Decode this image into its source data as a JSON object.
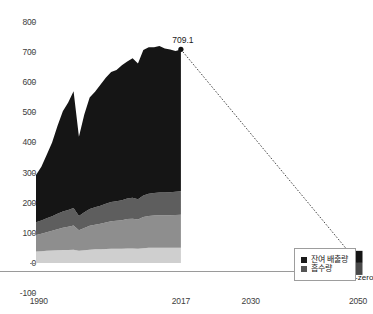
{
  "chart_data": {
    "type": "area",
    "title": "",
    "subtitle": "",
    "xlabel": "",
    "ylabel": "",
    "xlim": [
      1990,
      2050
    ],
    "ylim": [
      -100,
      800
    ],
    "ytick_labels": [
      "800",
      "700",
      "600",
      "500",
      "400",
      "300",
      "200",
      "100",
      "0",
      "-100"
    ],
    "ytick_values": [
      800,
      700,
      600,
      500,
      400,
      300,
      200,
      100,
      0,
      -100
    ],
    "xtick_labels": [
      "1990",
      "2017",
      "2030",
      "2050"
    ],
    "xtick_values": [
      1990,
      2017,
      2030,
      2050
    ],
    "grid": false,
    "legend_position": "bottom-right",
    "legend": [
      {
        "label": "잔여 배출량",
        "color": "#1a1a1a"
      },
      {
        "label": "흡수량",
        "color": "#555555"
      }
    ],
    "annotations": [
      {
        "text": "709.1",
        "x": 2017,
        "y": 709.1
      },
      {
        "text": "Net-zero",
        "x": 2050,
        "y": 0
      }
    ],
    "x": [
      1990,
      1991,
      1992,
      1993,
      1994,
      1995,
      1996,
      1997,
      1998,
      1999,
      2000,
      2001,
      2002,
      2003,
      2004,
      2005,
      2006,
      2007,
      2008,
      2009,
      2010,
      2011,
      2012,
      2013,
      2014,
      2015,
      2016,
      2017
    ],
    "series": [
      {
        "name": "layer-1-light",
        "color": "#cfcfcf",
        "values": [
          38,
          39,
          40,
          41,
          42,
          43,
          43,
          44,
          40,
          42,
          44,
          45,
          45,
          46,
          47,
          47,
          47,
          48,
          48,
          47,
          49,
          50,
          50,
          50,
          50,
          50,
          50,
          50
        ]
      },
      {
        "name": "layer-2-mid",
        "color": "#8e8e8e",
        "values": [
          55,
          58,
          62,
          66,
          70,
          74,
          77,
          80,
          68,
          74,
          79,
          82,
          85,
          88,
          91,
          93,
          95,
          98,
          99,
          97,
          103,
          106,
          107,
          108,
          108,
          108,
          109,
          110
        ]
      },
      {
        "name": "layer-3-dark",
        "color": "#5e5e5e",
        "values": [
          42,
          44,
          46,
          48,
          51,
          54,
          56,
          58,
          48,
          52,
          56,
          58,
          60,
          62,
          64,
          65,
          66,
          68,
          69,
          67,
          72,
          74,
          75,
          76,
          76,
          77,
          77,
          78
        ]
      },
      {
        "name": "layer-4-black",
        "color": "#151515",
        "values": [
          157,
          178,
          211,
          245,
          292,
          333,
          357,
          388,
          263,
          325,
          370,
          383,
          402,
          419,
          432,
          436,
          448,
          455,
          464,
          451,
          483,
          486,
          484,
          486,
          478,
          474,
          468,
          471
        ]
      }
    ],
    "total_values": [
      292,
      319,
      359,
      400,
      455,
      504,
      533,
      570,
      419,
      493,
      549,
      568,
      592,
      615,
      634,
      641,
      656,
      669,
      680,
      662,
      707,
      716,
      716,
      720,
      712,
      709,
      704,
      709.1
    ],
    "projection": {
      "from": {
        "x": 2017,
        "y": 709.1
      },
      "to": {
        "x": 2050,
        "y": 0
      },
      "style": "dotted",
      "label": "Net-zero"
    },
    "netzero_marker": {
      "x": 2050,
      "residual": 40,
      "absorption": -40
    }
  }
}
